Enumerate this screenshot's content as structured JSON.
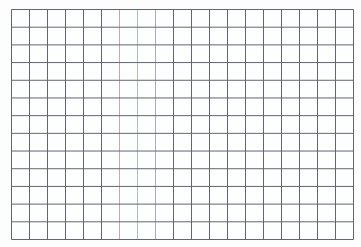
{
  "page": {
    "background_color": "#fdfdfd",
    "content_description": "blank-squared-grid-paper"
  },
  "grid": {
    "columns": 19,
    "rows": 13,
    "left": 11,
    "top": 9,
    "width": 343,
    "height": 231,
    "line_color": "#63666f",
    "line_width": 1,
    "cell_color": "#fdfefe",
    "colored_vertical_lines": [
      {
        "line_index": 6,
        "color": "#cfa3ab",
        "name": "pink-vertical-grid-line"
      },
      {
        "line_index": 7,
        "color": "#a5c8ae",
        "name": "green-vertical-grid-line"
      },
      {
        "line_index": 8,
        "color": "#a4abd3",
        "name": "blue-vertical-grid-line"
      }
    ]
  }
}
